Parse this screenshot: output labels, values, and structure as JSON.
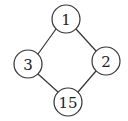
{
  "diagram": {
    "type": "hasse-diagram",
    "nodes": [
      {
        "id": "n1",
        "label": "1",
        "cx": 66,
        "cy": 19,
        "r": 14
      },
      {
        "id": "n3",
        "label": "3",
        "cx": 28,
        "cy": 64,
        "r": 14
      },
      {
        "id": "n2",
        "label": "2",
        "cx": 106,
        "cy": 61,
        "r": 14
      },
      {
        "id": "n15",
        "label": "15",
        "cx": 68,
        "cy": 102,
        "r": 14
      }
    ],
    "edges": [
      {
        "from": "n1",
        "to": "n3"
      },
      {
        "from": "n1",
        "to": "n2"
      },
      {
        "from": "n3",
        "to": "n15"
      },
      {
        "from": "n2",
        "to": "n15"
      }
    ]
  }
}
